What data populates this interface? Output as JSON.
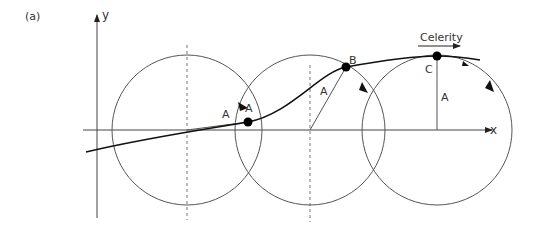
{
  "figure": {
    "panel_label": "(a)",
    "axes": {
      "x_label": "x",
      "y_label": "y"
    },
    "celerity_label": "Celerity",
    "points": [
      {
        "name": "A",
        "label": "A"
      },
      {
        "name": "B",
        "label": "B"
      },
      {
        "name": "C",
        "label": "C"
      }
    ],
    "radius_labels": [
      "A",
      "A",
      "A"
    ],
    "colors": {
      "line": "#222222",
      "circle": "#555555",
      "text": "#333333"
    }
  }
}
